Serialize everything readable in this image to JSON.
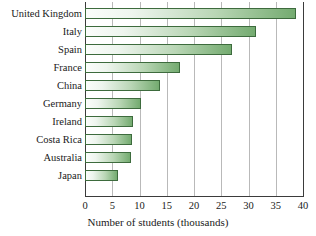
{
  "chart_data": {
    "type": "bar",
    "orientation": "horizontal",
    "title": "",
    "xlabel": "Number of students (thousands)",
    "ylabel": "",
    "xlim": [
      0,
      40
    ],
    "xticks": [
      0,
      5,
      10,
      15,
      20,
      25,
      30,
      35,
      40
    ],
    "grid": true,
    "legend": false,
    "categories": [
      "United Kingdom",
      "Italy",
      "Spain",
      "France",
      "China",
      "Germany",
      "Ireland",
      "Costa Rica",
      "Australia",
      "Japan"
    ],
    "values": [
      38.7,
      31.4,
      27.0,
      17.4,
      13.8,
      10.3,
      8.8,
      8.6,
      8.4,
      6.0
    ],
    "series": [
      {
        "name": "Number of students (thousands)",
        "values": [
          38.7,
          31.4,
          27.0,
          17.4,
          13.8,
          10.3,
          8.8,
          8.6,
          8.4,
          6.0
        ]
      }
    ]
  },
  "style": {
    "bar_fill_light": "#fbfdfb",
    "bar_fill_dark": "#74ab70",
    "bar_border": "#3d6b3d",
    "gridline_color": "#b9b9b9",
    "axis_color": "#3b3b3b",
    "background": "#ffffff",
    "text_color": "#1a1a1a"
  }
}
